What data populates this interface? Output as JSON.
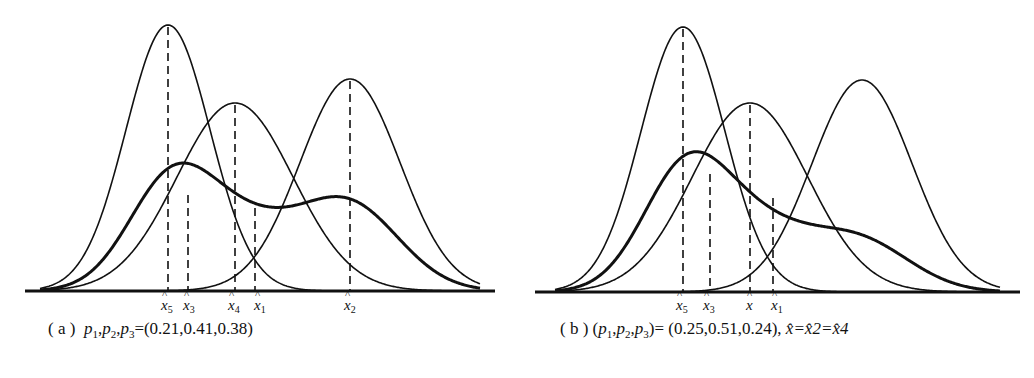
{
  "panels": [
    {
      "id": "a",
      "caption_prefix": "( a )",
      "caption_text": "p1,p2,p3=(0.21,0.41,0.38)",
      "caption_parts": {
        "vars": "p1, p2, p3",
        "eq": "=(0.21,0.41,0.38)"
      },
      "markers": [
        {
          "label": "x̂5",
          "sub": "5",
          "x": 168
        },
        {
          "label": "x̂3",
          "sub": "3",
          "x": 188
        },
        {
          "label": "x̂4",
          "sub": "4",
          "x": 235
        },
        {
          "label": "x̂1",
          "sub": "1",
          "x": 255
        },
        {
          "label": "x̂2",
          "sub": "2",
          "x": 350
        }
      ]
    },
    {
      "id": "b",
      "caption_prefix": "( b )",
      "caption_text": "(p1,p2,p3)=(0.25,0.51,0.24), x̂=x̂2=x̂4",
      "caption_parts": {
        "vars": "(p1, p2, p3)",
        "eq": "= (0.25,0.51,0.24), ",
        "tail": "x̂=x̂2=x̂4"
      },
      "markers": [
        {
          "label": "x̂5",
          "sub": "5",
          "x": 683
        },
        {
          "label": "x̂3",
          "sub": "3",
          "x": 710
        },
        {
          "label": "x̂",
          "sub": "",
          "x": 750
        },
        {
          "label": "x̂1",
          "sub": "1",
          "x": 773
        }
      ]
    }
  ],
  "chart_data": [
    {
      "type": "line",
      "title": "(a) p1,p2,p3=(0.21,0.41,0.38)",
      "description": "Three Gaussian component densities and their thick-line mixture density; dashed lines mark component means and mixture estimates",
      "series": [
        {
          "name": "component x̂5",
          "mean_px": 168,
          "peak_height": 1.0
        },
        {
          "name": "component x̂4",
          "mean_px": 235,
          "peak_height": 0.71
        },
        {
          "name": "component x̂2",
          "mean_px": 350,
          "peak_height": 0.8
        },
        {
          "name": "mixture (thick)",
          "modes_px": [
            188,
            340
          ],
          "mode_heights": [
            0.37,
            0.34
          ]
        }
      ],
      "x_markers": [
        "x̂5",
        "x̂3",
        "x̂4",
        "x̂1",
        "x̂2"
      ],
      "weights": [
        0.21,
        0.41,
        0.38
      ],
      "xlabel": "",
      "ylabel": "",
      "grid": false
    },
    {
      "type": "line",
      "title": "(b) (p1,p2,p3)=(0.25,0.51,0.24), x̂=x̂2=x̂4",
      "description": "Three Gaussian component densities and their thick-line mixture density with one main mode and a right shoulder",
      "series": [
        {
          "name": "component x̂5",
          "mean_px": 683,
          "peak_height": 1.0
        },
        {
          "name": "component x̂",
          "mean_px": 750,
          "peak_height": 0.71
        },
        {
          "name": "component right",
          "mean_px": 862,
          "peak_height": 0.8
        },
        {
          "name": "mixture (thick)",
          "modes_px": [
            710
          ],
          "mode_heights": [
            0.45
          ]
        }
      ],
      "x_markers": [
        "x̂5",
        "x̂3",
        "x̂",
        "x̂1"
      ],
      "weights": [
        0.25,
        0.51,
        0.24
      ],
      "xlabel": "",
      "ylabel": "",
      "grid": false
    }
  ]
}
